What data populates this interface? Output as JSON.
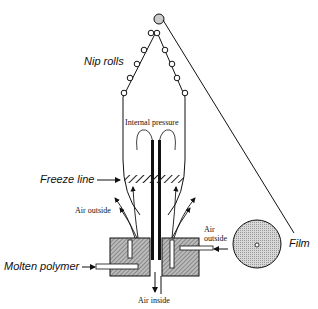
{
  "labels": {
    "nip_rolls": "Nip rolls",
    "internal_pressure": "Internal pressure",
    "freeze_line": "Freeze line",
    "air_outside_left": "Air outside",
    "air_outside_right_1": "Air",
    "air_outside_right_2": "outside",
    "film": "Film",
    "molten_polymer": "Molten  polymer",
    "air_inside": "Air inside"
  }
}
